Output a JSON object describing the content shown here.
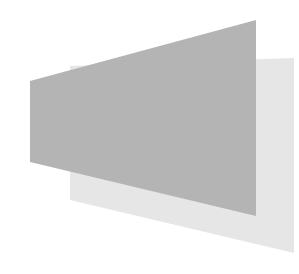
{
  "image": {
    "width": 299,
    "height": 274,
    "background": "#ffffff"
  },
  "shapes": [
    {
      "name": "back-panel",
      "points": "70,66 294,58 294,253 70,200",
      "fill": "#e6e6e6"
    },
    {
      "name": "front-panel",
      "points": "30,81 256,20 256,216 30,162",
      "fill": "#b4b4b4"
    }
  ]
}
